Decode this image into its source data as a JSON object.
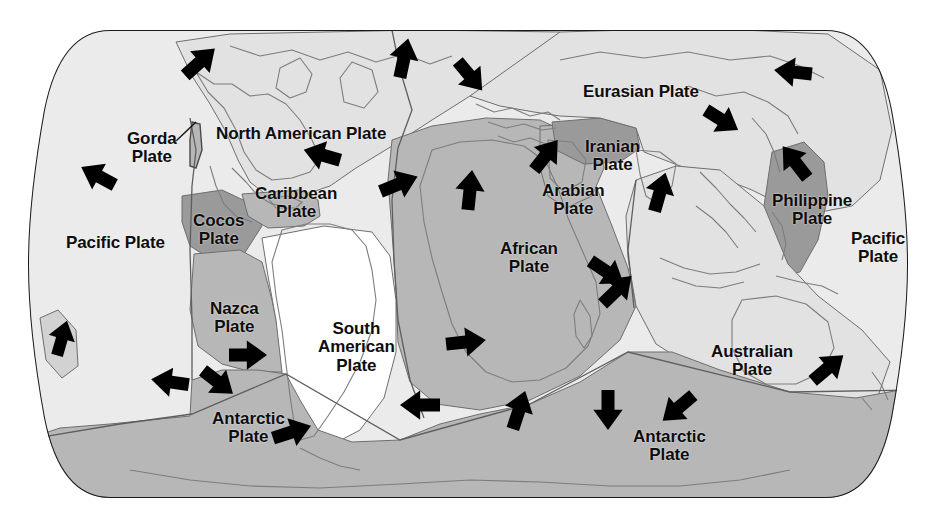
{
  "figure": {
    "kind": "world-tectonic-plates-map",
    "projection": "robinson-like-rounded-rectangle",
    "background_color": "#ffffff",
    "outline_color": "#1a1a1a",
    "coastline_color": "#777777",
    "boundary_color": "#6e6e6e",
    "arrow_color": "#000000",
    "text_color": "#0d0d0d"
  },
  "palette": {
    "white_plate": "#ffffff",
    "very_light_gray": "#ebebeb",
    "light_gray": "#e2e2e2",
    "mid_gray": "#b7b7b7",
    "dark_gray": "#9a9a9a"
  },
  "labels": [
    {
      "name": "gorda-plate",
      "text": "Gorda\nPlate",
      "x": 127,
      "y": 130,
      "size": 17,
      "has_leader_line": true
    },
    {
      "name": "north-american-plate",
      "text": "North American Plate",
      "x": 216,
      "y": 125,
      "size": 17,
      "has_leader_line": false
    },
    {
      "name": "pacific-plate-left",
      "text": "Pacific Plate",
      "x": 66,
      "y": 234,
      "size": 17,
      "has_leader_line": false
    },
    {
      "name": "cocos-plate",
      "text": "Cocos\nPlate",
      "x": 193,
      "y": 212,
      "size": 17,
      "has_leader_line": false
    },
    {
      "name": "caribbean-plate",
      "text": "Caribbean\nPlate",
      "x": 255,
      "y": 185,
      "size": 17,
      "has_leader_line": false
    },
    {
      "name": "nazca-plate",
      "text": "Nazca\nPlate",
      "x": 210,
      "y": 300,
      "size": 17,
      "has_leader_line": false
    },
    {
      "name": "south-american-plate",
      "text": "South\nAmerican\nPlate",
      "x": 318,
      "y": 320,
      "size": 17,
      "has_leader_line": false
    },
    {
      "name": "antarctic-plate-left",
      "text": "Antarctic\nPlate",
      "x": 212,
      "y": 410,
      "size": 17,
      "has_leader_line": false
    },
    {
      "name": "african-plate",
      "text": "African\nPlate",
      "x": 500,
      "y": 240,
      "size": 17,
      "has_leader_line": false
    },
    {
      "name": "arabian-plate",
      "text": "Arabian\nPlate",
      "x": 542,
      "y": 182,
      "size": 17,
      "has_leader_line": false
    },
    {
      "name": "iranian-plate",
      "text": "Iranian\nPlate",
      "x": 585,
      "y": 138,
      "size": 17,
      "has_leader_line": false
    },
    {
      "name": "eurasian-plate",
      "text": "Eurasian Plate",
      "x": 583,
      "y": 83,
      "size": 17,
      "has_leader_line": false
    },
    {
      "name": "philippine-plate",
      "text": "Philippine\nPlate",
      "x": 772,
      "y": 192,
      "size": 17,
      "has_leader_line": false
    },
    {
      "name": "pacific-plate-right",
      "text": "Pacific\nPlate",
      "x": 851,
      "y": 230,
      "size": 17,
      "has_leader_line": false
    },
    {
      "name": "australian-plate",
      "text": "Australian\nPlate",
      "x": 711,
      "y": 343,
      "size": 17,
      "has_leader_line": false
    },
    {
      "name": "antarctic-plate-right",
      "text": "Antarctic\nPlate",
      "x": 633,
      "y": 428,
      "size": 17,
      "has_leader_line": false
    }
  ],
  "plates": [
    {
      "name": "pacific-plate",
      "label": "Pacific Plate",
      "fill": "#ebebeb",
      "motion": "northwest"
    },
    {
      "name": "north-american-plate",
      "label": "North American Plate",
      "fill": "#e2e2e2",
      "motion": "west-southwest"
    },
    {
      "name": "gorda-plate",
      "label": "Gorda Plate",
      "fill": "#b7b7b7",
      "motion": "northeast"
    },
    {
      "name": "cocos-plate",
      "label": "Cocos Plate",
      "fill": "#9a9a9a",
      "motion": "northeast"
    },
    {
      "name": "caribbean-plate",
      "label": "Caribbean Plate",
      "fill": "#b7b7b7",
      "motion": "east"
    },
    {
      "name": "nazca-plate",
      "label": "Nazca Plate",
      "fill": "#b7b7b7",
      "motion": "east"
    },
    {
      "name": "south-american-plate",
      "label": "South American Plate",
      "fill": "#ffffff",
      "motion": "west"
    },
    {
      "name": "african-plate",
      "label": "African Plate",
      "fill": "#b7b7b7",
      "motion": "north-northeast"
    },
    {
      "name": "arabian-plate",
      "label": "Arabian Plate",
      "fill": "#b7b7b7",
      "motion": "northeast"
    },
    {
      "name": "iranian-plate",
      "label": "Iranian Plate",
      "fill": "#9a9a9a",
      "motion": "northeast"
    },
    {
      "name": "eurasian-plate",
      "label": "Eurasian Plate",
      "fill": "#e2e2e2",
      "motion": "east-southeast"
    },
    {
      "name": "philippine-plate",
      "label": "Philippine Plate",
      "fill": "#9a9a9a",
      "motion": "northwest"
    },
    {
      "name": "australian-plate",
      "label": "Australian Plate",
      "fill": "#e2e2e2",
      "motion": "north-northeast"
    },
    {
      "name": "antarctic-plate",
      "label": "Antarctic Plate",
      "fill": "#b7b7b7",
      "motion": "radial-outward"
    }
  ],
  "motion_arrows": [
    {
      "name": "arrow-pacific-nw-alaska",
      "x": 200,
      "y": 62,
      "angle": -42,
      "len": 40,
      "w": 13
    },
    {
      "name": "arrow-greenland-n",
      "x": 404,
      "y": 58,
      "angle": -78,
      "len": 40,
      "w": 13
    },
    {
      "name": "arrow-n-atlantic-se",
      "x": 470,
      "y": 76,
      "angle": 50,
      "len": 38,
      "w": 13
    },
    {
      "name": "arrow-eurasia-ne-edge",
      "x": 793,
      "y": 72,
      "angle": 186,
      "len": 38,
      "w": 13
    },
    {
      "name": "arrow-eurasia-ese",
      "x": 722,
      "y": 120,
      "angle": 32,
      "len": 38,
      "w": 13
    },
    {
      "name": "arrow-gorda-nw",
      "x": 98,
      "y": 176,
      "angle": -152,
      "len": 38,
      "w": 13
    },
    {
      "name": "arrow-namerica-wsw",
      "x": 322,
      "y": 155,
      "angle": 196,
      "len": 38,
      "w": 13
    },
    {
      "name": "arrow-atlantic-ridge-e",
      "x": 399,
      "y": 184,
      "angle": -22,
      "len": 40,
      "w": 13
    },
    {
      "name": "arrow-africa-n",
      "x": 470,
      "y": 190,
      "angle": -84,
      "len": 40,
      "w": 13
    },
    {
      "name": "arrow-arabia-ne",
      "x": 546,
      "y": 155,
      "angle": -52,
      "len": 38,
      "w": 13
    },
    {
      "name": "arrow-india-n",
      "x": 660,
      "y": 192,
      "angle": -74,
      "len": 40,
      "w": 13
    },
    {
      "name": "arrow-philippine-nw",
      "x": 795,
      "y": 162,
      "angle": -128,
      "len": 40,
      "w": 13
    },
    {
      "name": "arrow-nazca-e",
      "x": 248,
      "y": 355,
      "angle": 0,
      "len": 38,
      "w": 13
    },
    {
      "name": "arrow-pacific-sw-rise",
      "x": 170,
      "y": 382,
      "angle": 188,
      "len": 38,
      "w": 13
    },
    {
      "name": "arrow-antarctic-se",
      "x": 218,
      "y": 382,
      "angle": 38,
      "len": 38,
      "w": 13
    },
    {
      "name": "arrow-pacific-far-left-n",
      "x": 62,
      "y": 338,
      "angle": -74,
      "len": 36,
      "w": 12
    },
    {
      "name": "arrow-antarctic-ne-chile",
      "x": 292,
      "y": 432,
      "angle": -18,
      "len": 40,
      "w": 13
    },
    {
      "name": "arrow-satlantic-w",
      "x": 420,
      "y": 405,
      "angle": 180,
      "len": 40,
      "w": 13
    },
    {
      "name": "arrow-satlantic-e",
      "x": 466,
      "y": 342,
      "angle": -6,
      "len": 40,
      "w": 13
    },
    {
      "name": "arrow-africa-se",
      "x": 607,
      "y": 272,
      "angle": 34,
      "len": 40,
      "w": 13
    },
    {
      "name": "arrow-sw-indian-ne",
      "x": 519,
      "y": 410,
      "angle": -72,
      "len": 40,
      "w": 13
    },
    {
      "name": "arrow-se-indian-ne",
      "x": 617,
      "y": 290,
      "angle": -44,
      "len": 40,
      "w": 13
    },
    {
      "name": "arrow-antarctic-s",
      "x": 608,
      "y": 410,
      "angle": 90,
      "len": 40,
      "w": 13
    },
    {
      "name": "arrow-antarctic-sw",
      "x": 678,
      "y": 408,
      "angle": 140,
      "len": 40,
      "w": 13
    },
    {
      "name": "arrow-australia-ne",
      "x": 828,
      "y": 368,
      "angle": -40,
      "len": 40,
      "w": 13
    }
  ]
}
